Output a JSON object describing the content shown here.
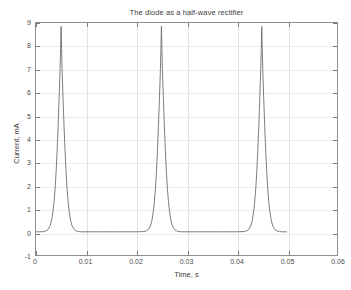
{
  "figure": {
    "background_color": "#ffffff",
    "axis_color": "#8d8d8d",
    "grid_color": "#e3e3e3",
    "line_color": "#6e6e6e"
  },
  "chart_data": {
    "type": "line",
    "title": "The diode as a half-wave rectifier",
    "xlabel": "Time, s",
    "ylabel": "Current, mA",
    "xlim": [
      0,
      0.06
    ],
    "ylim": [
      -1,
      9
    ],
    "xticks": [
      0,
      0.01,
      0.02,
      0.03,
      0.04,
      0.05,
      0.06
    ],
    "xtick_labels": [
      "0",
      "0.01",
      "0.02",
      "0.03",
      "0.04",
      "0.05",
      "0.06"
    ],
    "yticks": [
      -1,
      0,
      1,
      2,
      3,
      4,
      5,
      6,
      7,
      8,
      9
    ],
    "ytick_labels": [
      "-1",
      "0",
      "1",
      "2",
      "3",
      "4",
      "5",
      "6",
      "7",
      "8",
      "9"
    ],
    "grid": true,
    "legend": null,
    "series": [
      {
        "name": "Diode current",
        "peak_value": 8.85,
        "baseline_value": 0,
        "pulse_period": 0.02,
        "pulse_centers": [
          0.005,
          0.025,
          0.045
        ],
        "data_end": 0.05,
        "points": [
          [
            0.0,
            0.0
          ],
          [
            0.0005,
            0.0
          ],
          [
            0.001,
            0.0
          ],
          [
            0.0015,
            0.01
          ],
          [
            0.002,
            0.04
          ],
          [
            0.0024,
            0.1
          ],
          [
            0.0028,
            0.25
          ],
          [
            0.0031,
            0.48
          ],
          [
            0.0034,
            0.9
          ],
          [
            0.0036,
            1.3
          ],
          [
            0.0038,
            1.85
          ],
          [
            0.004,
            2.55
          ],
          [
            0.0042,
            3.45
          ],
          [
            0.0044,
            4.5
          ],
          [
            0.0046,
            5.7
          ],
          [
            0.0048,
            7.0
          ],
          [
            0.0049,
            7.9
          ],
          [
            0.005,
            8.85
          ],
          [
            0.0051,
            7.9
          ],
          [
            0.0052,
            7.0
          ],
          [
            0.0054,
            5.7
          ],
          [
            0.0056,
            4.5
          ],
          [
            0.0058,
            3.45
          ],
          [
            0.006,
            2.55
          ],
          [
            0.0062,
            1.85
          ],
          [
            0.0064,
            1.3
          ],
          [
            0.0066,
            0.9
          ],
          [
            0.0069,
            0.48
          ],
          [
            0.0072,
            0.25
          ],
          [
            0.0076,
            0.1
          ],
          [
            0.008,
            0.04
          ],
          [
            0.0085,
            0.01
          ],
          [
            0.009,
            0.0
          ],
          [
            0.012,
            0.0
          ],
          [
            0.016,
            0.0
          ],
          [
            0.02,
            0.0
          ],
          [
            0.0215,
            0.01
          ],
          [
            0.022,
            0.04
          ],
          [
            0.0224,
            0.1
          ],
          [
            0.0228,
            0.25
          ],
          [
            0.0231,
            0.48
          ],
          [
            0.0234,
            0.9
          ],
          [
            0.0236,
            1.3
          ],
          [
            0.0238,
            1.85
          ],
          [
            0.024,
            2.55
          ],
          [
            0.0242,
            3.45
          ],
          [
            0.0244,
            4.5
          ],
          [
            0.0246,
            5.7
          ],
          [
            0.0248,
            7.0
          ],
          [
            0.0249,
            7.9
          ],
          [
            0.025,
            8.85
          ],
          [
            0.0251,
            7.9
          ],
          [
            0.0252,
            7.0
          ],
          [
            0.0254,
            5.7
          ],
          [
            0.0256,
            4.5
          ],
          [
            0.0258,
            3.45
          ],
          [
            0.026,
            2.55
          ],
          [
            0.0262,
            1.85
          ],
          [
            0.0264,
            1.3
          ],
          [
            0.0266,
            0.9
          ],
          [
            0.0269,
            0.48
          ],
          [
            0.0272,
            0.25
          ],
          [
            0.0276,
            0.1
          ],
          [
            0.028,
            0.04
          ],
          [
            0.0285,
            0.01
          ],
          [
            0.029,
            0.0
          ],
          [
            0.032,
            0.0
          ],
          [
            0.036,
            0.0
          ],
          [
            0.04,
            0.0
          ],
          [
            0.0415,
            0.01
          ],
          [
            0.042,
            0.04
          ],
          [
            0.0424,
            0.1
          ],
          [
            0.0428,
            0.25
          ],
          [
            0.0431,
            0.48
          ],
          [
            0.0434,
            0.9
          ],
          [
            0.0436,
            1.3
          ],
          [
            0.0438,
            1.85
          ],
          [
            0.044,
            2.55
          ],
          [
            0.0442,
            3.45
          ],
          [
            0.0444,
            4.5
          ],
          [
            0.0446,
            5.7
          ],
          [
            0.0448,
            7.0
          ],
          [
            0.0449,
            7.9
          ],
          [
            0.045,
            8.85
          ],
          [
            0.0451,
            7.9
          ],
          [
            0.0452,
            7.0
          ],
          [
            0.0454,
            5.7
          ],
          [
            0.0456,
            4.5
          ],
          [
            0.0458,
            3.45
          ],
          [
            0.046,
            2.55
          ],
          [
            0.0462,
            1.85
          ],
          [
            0.0464,
            1.3
          ],
          [
            0.0466,
            0.9
          ],
          [
            0.0469,
            0.48
          ],
          [
            0.0472,
            0.25
          ],
          [
            0.0476,
            0.1
          ],
          [
            0.048,
            0.04
          ],
          [
            0.0485,
            0.01
          ],
          [
            0.049,
            0.0
          ],
          [
            0.0495,
            0.0
          ],
          [
            0.05,
            0.0
          ]
        ]
      }
    ]
  }
}
